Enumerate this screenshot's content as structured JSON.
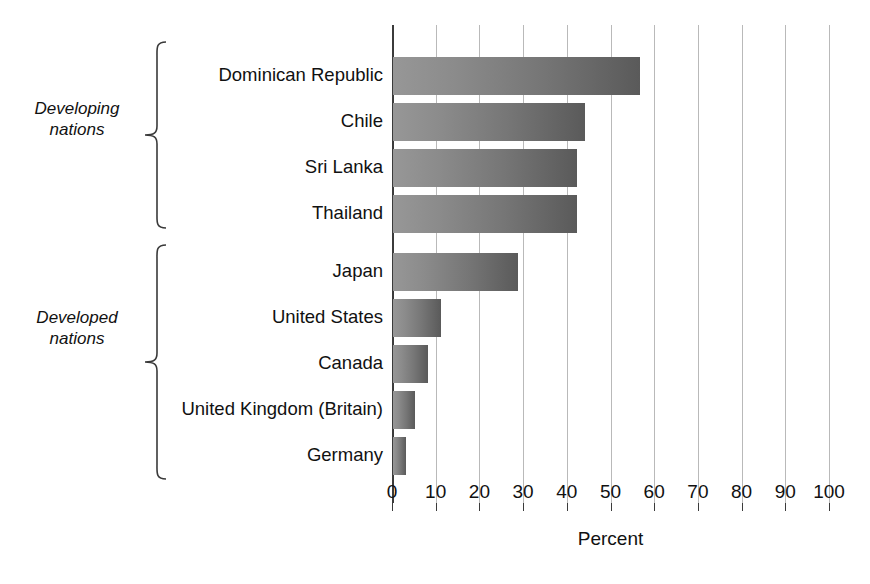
{
  "chart_data": {
    "type": "bar",
    "orientation": "horizontal",
    "title": "",
    "xlabel": "Percent",
    "ylabel": "",
    "xlim": [
      0,
      100
    ],
    "xticks": [
      0,
      10,
      20,
      30,
      40,
      50,
      60,
      70,
      80,
      90,
      100
    ],
    "grid": true,
    "legend": false,
    "categories": [
      "Dominican Republic",
      "Chile",
      "Sri Lanka",
      "Thailand",
      "Japan",
      "United States",
      "Canada",
      "United Kingdom (Britain)",
      "Germany"
    ],
    "values": [
      56.5,
      44,
      42,
      42,
      28.5,
      11,
      8,
      5,
      3
    ],
    "groups": [
      {
        "label": "Developing\nnations",
        "categories": [
          "Dominican Republic",
          "Chile",
          "Sri Lanka",
          "Thailand"
        ],
        "values": [
          56.5,
          44,
          42,
          42
        ]
      },
      {
        "label": "Developed\nnations",
        "categories": [
          "Japan",
          "United States",
          "Canada",
          "United Kingdom (Britain)",
          "Germany"
        ],
        "values": [
          28.5,
          11,
          8,
          5,
          3
        ]
      }
    ],
    "bars": [
      {
        "category": "Dominican Republic",
        "value": 56.5,
        "group": "Developing nations",
        "top": 32
      },
      {
        "category": "Chile",
        "value": 44,
        "group": "Developing nations",
        "top": 78
      },
      {
        "category": "Sri Lanka",
        "value": 42,
        "group": "Developing nations",
        "top": 124
      },
      {
        "category": "Thailand",
        "value": 42,
        "group": "Developing nations",
        "top": 170
      },
      {
        "category": "Japan",
        "value": 28.5,
        "group": "Developed nations",
        "top": 228
      },
      {
        "category": "United States",
        "value": 11,
        "group": "Developed nations",
        "top": 274
      },
      {
        "category": "Canada",
        "value": 8,
        "group": "Developed nations",
        "top": 320
      },
      {
        "category": "United Kingdom (Britain)",
        "value": 5,
        "group": "Developed nations",
        "top": 366
      },
      {
        "category": "Germany",
        "value": 3,
        "group": "Developed nations",
        "top": 412
      }
    ],
    "colors": {
      "bar_gradient_start": "#979797",
      "bar_gradient_end": "#5a5a5a",
      "gridline": "#b9b9b9",
      "axis": "#3b3b3b",
      "text": "#111111",
      "background": "#ffffff"
    }
  }
}
